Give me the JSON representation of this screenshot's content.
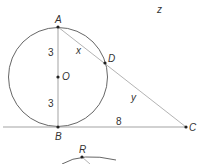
{
  "diagram": {
    "labels": {
      "top_variable": "z",
      "point_A": "A",
      "point_B": "B",
      "point_C": "C",
      "point_D": "D",
      "point_O": "O",
      "point_R": "R",
      "segment_AO": "3",
      "segment_OB": "3",
      "segment_AD": "x",
      "segment_DC": "y",
      "segment_BC": "8"
    },
    "colors": {
      "circle_stroke": "#555555",
      "secant_stroke": "#aaaaaa",
      "tangent_stroke": "#999999",
      "point_fill": "#222222"
    }
  }
}
